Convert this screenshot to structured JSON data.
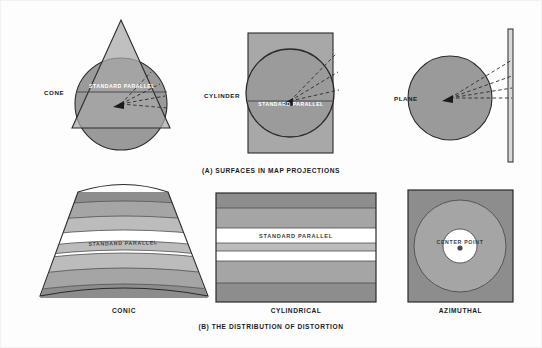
{
  "figure": {
    "title_a": "(A) SURFACES IN MAP PROJECTIONS",
    "title_b": "(B) THE DISTRIBUTION OF DISTORTION"
  },
  "panel_a": {
    "items": [
      {
        "label": "CONE",
        "surface": "cone",
        "annotation": "STANDARD PARALLEL"
      },
      {
        "label": "CYLINDER",
        "surface": "cylinder",
        "annotation": "STANDARD PARALLEL"
      },
      {
        "label": "PLANE",
        "surface": "plane",
        "annotation": ""
      }
    ]
  },
  "panel_b": {
    "items": [
      {
        "label": "CONIC",
        "annotation": "STANDARD PARALLEL"
      },
      {
        "label": "CYLINDRICAL",
        "annotation": "STANDARD PARALLEL"
      },
      {
        "label": "AZIMUTHAL",
        "annotation": "CENTER POINT"
      }
    ]
  },
  "colors": {
    "background": "#fdfdfe",
    "globe_fill": "#9a9a9a",
    "surface_fill": "#a8a8a8",
    "band_dark": "#8d8d8d",
    "band_mid": "#a5a5a5",
    "band_light": "#bcbcbc",
    "band_white": "#ffffff",
    "outline": "#2b2b2b",
    "text": "#1b1b1b"
  }
}
